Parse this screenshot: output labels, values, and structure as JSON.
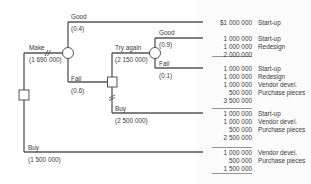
{
  "diagram": {
    "type": "decision-tree",
    "nodes": {
      "root_decision": {
        "shape": "square"
      },
      "make_chance": {
        "shape": "circle"
      },
      "fail_decision": {
        "shape": "square"
      },
      "try_again_chance": {
        "shape": "circle"
      }
    },
    "branches": {
      "make": {
        "label": "Make",
        "value": "(1 690 000)"
      },
      "good": {
        "label": "Good",
        "prob": "(0.4)"
      },
      "fail": {
        "label": "Fail",
        "prob": "(0.6)"
      },
      "try_again": {
        "label": "Try again",
        "value": "(2 150 000)"
      },
      "good2": {
        "label": "Good",
        "prob": "(0.9)"
      },
      "fail2": {
        "label": "Fail",
        "prob": "(0.1)"
      },
      "buy2": {
        "label": "Buy",
        "value": "(2 500 000)"
      },
      "buy": {
        "label": "Buy",
        "value": "(1 500 000)"
      }
    },
    "outcomes": [
      {
        "rows": [
          {
            "amount": "$1 000 000",
            "item": "Start-up"
          }
        ],
        "total": null
      },
      {
        "rows": [
          {
            "amount": "1 000 000",
            "item": "Start-up"
          },
          {
            "amount": "1 000 000",
            "item": "Redesign"
          }
        ],
        "total": "2 000 000"
      },
      {
        "rows": [
          {
            "amount": "1 000 000",
            "item": "Start-up"
          },
          {
            "amount": "1 000 000",
            "item": "Redesign"
          },
          {
            "amount": "1 000 000",
            "item": "Vendor devel."
          },
          {
            "amount": "500 000",
            "item": "Purchase pieces"
          }
        ],
        "total": "3 500 000"
      },
      {
        "rows": [
          {
            "amount": "1 000 000",
            "item": "Start-up"
          },
          {
            "amount": "1 000 000",
            "item": "Vendor devel."
          },
          {
            "amount": "500 000",
            "item": "Purchase pieces"
          }
        ],
        "total": "2 500 000"
      },
      {
        "rows": [
          {
            "amount": "1 000 000",
            "item": "Vendor devel."
          },
          {
            "amount": "500 000",
            "item": "Purchase pieces"
          }
        ],
        "total": "1 500 000"
      }
    ],
    "colors": {
      "line": "#555555",
      "node_fill": "#ffffff",
      "text": "#3a3a3a"
    }
  }
}
